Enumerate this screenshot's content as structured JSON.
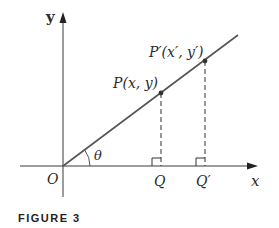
{
  "figure": {
    "caption": "FIGURE 3",
    "labels": {
      "y_axis": "y",
      "x_axis": "x",
      "origin": "O",
      "angle": "θ",
      "point_p": "P(x, y)",
      "point_p_prime": "P′(x′, y′)",
      "foot_q": "Q",
      "foot_q_prime": "Q′"
    },
    "colors": {
      "axis": "#3a3a3a",
      "line": "#555555",
      "text": "#2b2b2b"
    }
  }
}
